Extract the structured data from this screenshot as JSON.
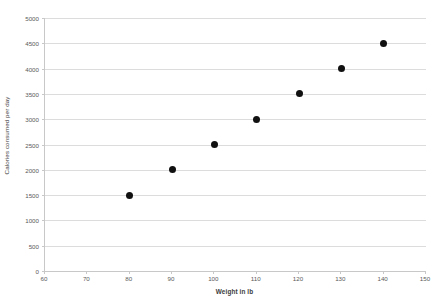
{
  "chart_data": {
    "type": "scatter",
    "title": "",
    "xlabel": "Weight in lb",
    "ylabel": "Calories consumed per day",
    "x": [
      80,
      90,
      100,
      110,
      120,
      130,
      140
    ],
    "values": [
      1500,
      2000,
      2500,
      3000,
      3500,
      4000,
      4500
    ],
    "series": [
      {
        "name": "",
        "points": [
          {
            "x": 80,
            "y": 1500
          },
          {
            "x": 90,
            "y": 2000
          },
          {
            "x": 100,
            "y": 2500
          },
          {
            "x": 110,
            "y": 3000
          },
          {
            "x": 120,
            "y": 3500
          },
          {
            "x": 130,
            "y": 4000
          },
          {
            "x": 140,
            "y": 4500
          }
        ]
      }
    ],
    "xlim": [
      60,
      150
    ],
    "ylim": [
      0,
      5000
    ],
    "xticks": [
      60,
      70,
      80,
      90,
      100,
      110,
      120,
      130,
      140,
      150
    ],
    "yticks": [
      0,
      500,
      1000,
      1500,
      2000,
      2500,
      3000,
      3500,
      4000,
      4500,
      5000
    ],
    "xtick_labels": [
      "60",
      "70",
      "80",
      "90",
      "100",
      "110",
      "120",
      "130",
      "140",
      "150"
    ],
    "ytick_labels": [
      "0",
      "500",
      "1000",
      "1500",
      "2000",
      "2500",
      "3000",
      "3500",
      "4000",
      "4500",
      "5000"
    ],
    "grid": "horizontal",
    "legend": "none",
    "marker_color": "#111111",
    "grid_color": "#dcdcdc",
    "axis_color": "#c8c8c8",
    "background_color": "#ffffff"
  }
}
